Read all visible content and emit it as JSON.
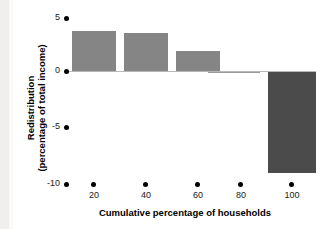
{
  "chart_data": {
    "type": "bar",
    "title": "",
    "xlabel": "Cumulative percentage of households",
    "ylabel_line1": "Redistribution",
    "ylabel_line2": "(percentage of total income)",
    "categories": [
      "20",
      "40",
      "60",
      "80",
      "100"
    ],
    "values": [
      3.6,
      3.4,
      1.8,
      -0.15,
      -9.1
    ],
    "xticks": [
      "20",
      "40",
      "60",
      "80",
      "100"
    ],
    "yticks": [
      "5",
      "0",
      "-5",
      "-10"
    ],
    "ylim": [
      -10,
      5
    ],
    "grid": false,
    "legend": "none",
    "series": [
      {
        "name": "Redistribution",
        "values": [
          3.6,
          3.4,
          1.8,
          -0.15,
          -9.1
        ]
      }
    ],
    "colors": {
      "positive_bar": "#858585",
      "negative_bar": "#4b4b4b",
      "axis_text": "#000000",
      "zero_line": "#b9b9b9",
      "background": "#ffffff"
    }
  }
}
